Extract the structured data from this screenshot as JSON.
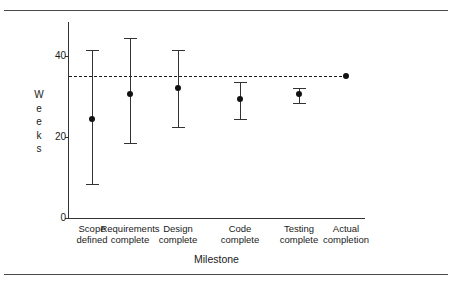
{
  "chart_data": {
    "type": "scatter",
    "title": "",
    "xlabel": "Milestone",
    "ylabel": "Weeks",
    "ylabel_letters": [
      "W",
      "e",
      "e",
      "k",
      "s"
    ],
    "categories": [
      "Scope defined",
      "Requirements complete",
      "Design complete",
      "Code complete",
      "Testing complete",
      "Actual completion"
    ],
    "category_lines": [
      [
        "Scope",
        "defined"
      ],
      [
        "Requirements",
        "complete"
      ],
      [
        "Design",
        "complete"
      ],
      [
        "Code",
        "complete"
      ],
      [
        "Testing",
        "complete"
      ],
      [
        "Actual",
        "completion"
      ]
    ],
    "values": [
      24.5,
      30.5,
      32.0,
      29.5,
      30.5,
      35.0
    ],
    "error_low": [
      8.5,
      18.5,
      22.5,
      24.5,
      28.5,
      null
    ],
    "error_high": [
      41.5,
      44.5,
      41.5,
      33.5,
      32.0,
      null
    ],
    "series": [
      {
        "name": "Estimated completion",
        "points": [
          {
            "category": "Scope defined",
            "value": 24.5,
            "low": 8.5,
            "high": 41.5
          },
          {
            "category": "Requirements complete",
            "value": 30.5,
            "low": 18.5,
            "high": 44.5
          },
          {
            "category": "Design complete",
            "value": 32.0,
            "low": 22.5,
            "high": 41.5
          },
          {
            "category": "Code complete",
            "value": 29.5,
            "low": 24.5,
            "high": 33.5
          },
          {
            "category": "Testing complete",
            "value": 30.5,
            "low": 28.5,
            "high": 32.0
          },
          {
            "category": "Actual completion",
            "value": 35.0,
            "low": null,
            "high": null
          }
        ]
      }
    ],
    "reference_line": {
      "value": 35,
      "style": "dashed",
      "label": ""
    },
    "ylim": [
      0,
      48
    ],
    "yticks": [
      0,
      20,
      40
    ],
    "ytick_labels": [
      "0",
      "20",
      "40"
    ],
    "grid": false,
    "legend": "none"
  }
}
